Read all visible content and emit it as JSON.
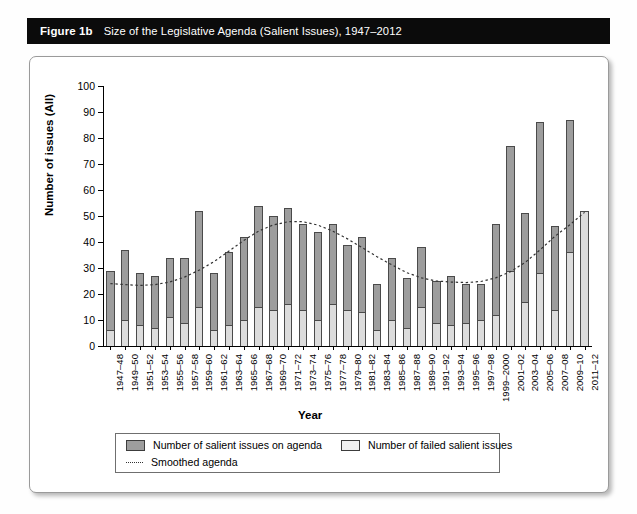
{
  "caption": {
    "number": "Figure 1b",
    "text": "Size of the Legislative Agenda (Salient Issues), 1947–2012"
  },
  "legend": {
    "items": [
      {
        "label": "Number of salient issues on agenda",
        "swatch": "dark-square-swatch",
        "color": "#9d9d9d"
      },
      {
        "label": "Number of failed salient issues",
        "swatch": "light-square-swatch",
        "color": "#f1f1f1"
      },
      {
        "label": "Smoothed agenda",
        "swatch": "dotted-line-swatch",
        "color": "#333333"
      }
    ]
  },
  "chart_data": {
    "type": "bar",
    "title": "Size of the Legislative Agenda (Salient Issues), 1947–2012",
    "xlabel": "Year",
    "ylabel": "Number of issues (All)",
    "ylim": [
      0,
      100
    ],
    "yticks": [
      0,
      10,
      20,
      30,
      40,
      50,
      60,
      70,
      80,
      90,
      100
    ],
    "grid": false,
    "legend_position": "below-axes",
    "stacked": true,
    "categories": [
      "1947–48",
      "1949–50",
      "1951–52",
      "1953–54",
      "1955–56",
      "1957–58",
      "1959–60",
      "1961–62",
      "1963–64",
      "1965–66",
      "1967–68",
      "1969–70",
      "1971–72",
      "1973–74",
      "1975–76",
      "1977–78",
      "1979–80",
      "1981–82",
      "1983–84",
      "1985–86",
      "1987–88",
      "1989–90",
      "1991–92",
      "1993–94",
      "1995–96",
      "1997–98",
      "1999–2000",
      "2001–02",
      "2003–04",
      "2005–06",
      "2007–08",
      "2009–10",
      "2011–12"
    ],
    "series": [
      {
        "name": "Number of salient issues on agenda",
        "color": "#9d9d9d",
        "values": [
          29,
          37,
          28,
          27,
          34,
          34,
          52,
          28,
          36,
          42,
          54,
          50,
          53,
          47,
          44,
          47,
          39,
          42,
          24,
          34,
          26,
          38,
          25,
          27,
          24,
          24,
          47,
          77,
          51,
          86,
          46,
          87,
          52
        ]
      },
      {
        "name": "Number of failed salient issues",
        "color": "#f1f1f1",
        "values": [
          6,
          10,
          8,
          7,
          11,
          9,
          15,
          6,
          8,
          10,
          15,
          14,
          16,
          14,
          10,
          16,
          14,
          13,
          6,
          10,
          7,
          15,
          9,
          8,
          9,
          10,
          12,
          29,
          17,
          28,
          14,
          36,
          52
        ]
      }
    ],
    "smoothed_agenda": {
      "name": "Smoothed agenda",
      "color": "#333333",
      "style": "dotted",
      "values": [
        24,
        23.6,
        23.3,
        23.6,
        24.6,
        26.5,
        29.2,
        32.5,
        36.5,
        40.6,
        44.2,
        46.6,
        47.8,
        47.8,
        46.5,
        44.2,
        41.2,
        37.8,
        34.3,
        31.2,
        28.2,
        26.2,
        25.0,
        24.6,
        24.4,
        24.8,
        26.2,
        28.6,
        32.2,
        37.0,
        42.2,
        46.6,
        51.4
      ]
    }
  }
}
